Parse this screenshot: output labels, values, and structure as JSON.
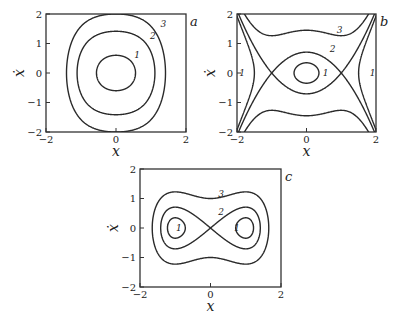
{
  "chart_data": [
    {
      "type": "line",
      "panel_label": "a",
      "title": "",
      "xlabel": "x",
      "ylabel": "ẋ",
      "xlim": [
        -2,
        2
      ],
      "ylim": [
        -2,
        2
      ],
      "xticks": [
        "−2",
        "0",
        "2"
      ],
      "yticks": [
        "−2",
        "−1",
        "0",
        "1",
        "2"
      ],
      "grid": false,
      "potential": "hardening: ẋ² = 2E − x² − x⁴/2",
      "series": [
        {
          "name": "1",
          "twoE": 0.36,
          "closed": true,
          "label_at": [
            0.6,
            0.6
          ]
        },
        {
          "name": "2",
          "twoE": 2.0,
          "closed": true,
          "label_at": [
            1.05,
            1.25
          ]
        },
        {
          "name": "3",
          "twoE": 4.0,
          "closed": true,
          "label_at": [
            1.35,
            1.65
          ]
        }
      ]
    },
    {
      "type": "line",
      "panel_label": "b",
      "title": "",
      "xlabel": "x",
      "ylabel": "ẋ",
      "xlim": [
        -2,
        2
      ],
      "ylim": [
        -2,
        2
      ],
      "xticks": [
        "−2",
        "0",
        "2"
      ],
      "yticks": [
        "−2",
        "−1",
        "0",
        "1",
        "2"
      ],
      "grid": false,
      "potential": "softening: ẋ² = 2E − x² + x⁴/2",
      "series": [
        {
          "name": "1",
          "twoE": 0.12,
          "region": "inner",
          "label_at": [
            0.55,
            0.0
          ]
        },
        {
          "name": "1",
          "twoE": -0.28,
          "region": "outer",
          "label_at": [
            -1.85,
            0.0
          ],
          "label_at_2": [
            1.9,
            0.0
          ]
        },
        {
          "name": "2",
          "twoE": 0.5,
          "region": "separatrix",
          "label_at": [
            0.75,
            0.8
          ]
        },
        {
          "name": "3",
          "twoE": 2.1,
          "region": "passing",
          "label_at": [
            0.95,
            1.45
          ]
        }
      ]
    },
    {
      "type": "line",
      "panel_label": "c",
      "title": "",
      "xlabel": "x",
      "ylabel": "ẋ",
      "xlim": [
        -2,
        2
      ],
      "ylim": [
        -2,
        2
      ],
      "xticks": [
        "−2",
        "0",
        "2"
      ],
      "yticks": [
        "−2",
        "−1",
        "0",
        "1",
        "2"
      ],
      "grid": false,
      "potential": "double well: ẋ² = 2E + x² − x⁴/2",
      "series": [
        {
          "name": "1",
          "twoE": -0.38,
          "region": "wells",
          "label_at": [
            -0.9,
            0.0
          ],
          "label_at_2": [
            0.75,
            0.0
          ]
        },
        {
          "name": "2",
          "twoE": 0.0,
          "region": "separatrix",
          "label_at": [
            0.3,
            0.55
          ]
        },
        {
          "name": "3",
          "twoE": 1.0,
          "region": "outer",
          "label_at": [
            0.3,
            1.15
          ]
        }
      ]
    }
  ]
}
